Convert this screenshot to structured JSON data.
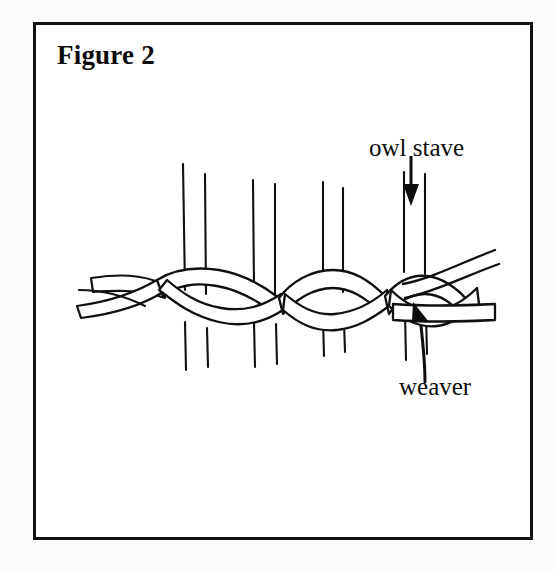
{
  "page": {
    "background_color": "#fcfcfa",
    "width": 557,
    "height": 572
  },
  "figure": {
    "title": "Figure 2",
    "border_color": "#111111",
    "border_width_px": 3,
    "ink_color": "#0d0d0d",
    "fill_color": "#ffffff",
    "caption_font_weight": "bold"
  },
  "labels": [
    {
      "name": "owl-stave",
      "text": "owl stave",
      "pointer": "arrow-down-icon",
      "points_at": "vertical stave (rightmost pair)"
    },
    {
      "name": "weaver",
      "text": "weaver",
      "pointer": "arrow-up-left-icon",
      "points_at": "horizontal weaver band at right edge"
    }
  ],
  "diagram": {
    "type": "line-drawing",
    "stave_count": 4,
    "weaver_strand_count": 2,
    "staves": [
      {
        "index": 0,
        "left_x": 149,
        "right_x": 171,
        "top_y": 140,
        "bottom_y": 345
      },
      {
        "index": 1,
        "left_x": 219,
        "right_x": 241,
        "top_y": 150,
        "bottom_y": 330
      },
      {
        "index": 2,
        "left_x": 289,
        "right_x": 309,
        "top_y": 152,
        "bottom_y": 320
      },
      {
        "index": 3,
        "left_x": 370,
        "right_x": 392,
        "top_y": 148,
        "bottom_y": 330
      }
    ]
  },
  "icons": {
    "arrow_down": "arrow-down-icon",
    "arrow_up_left": "arrow-up-left-icon"
  }
}
